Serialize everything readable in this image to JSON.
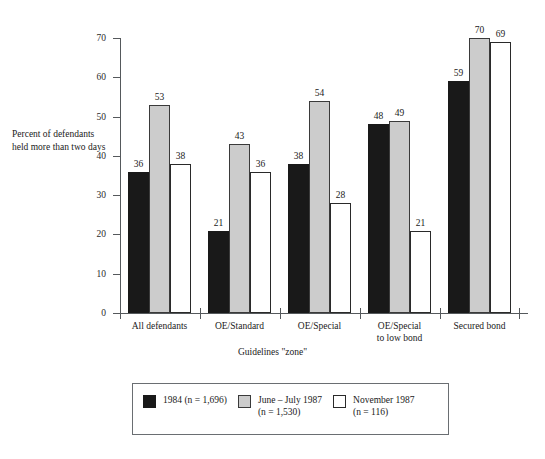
{
  "chart_data": {
    "type": "bar",
    "title": "",
    "xlabel": "Guidelines \"zone\"",
    "ylabel": "Percent of\ndefendants held\nmore than two days",
    "ylim": [
      0,
      70
    ],
    "yticks": [
      0,
      10,
      20,
      30,
      40,
      50,
      60,
      70
    ],
    "ytick_labels": [
      "0",
      "10",
      "20",
      "30",
      "40",
      "50",
      "60",
      "70"
    ],
    "grid": false,
    "legend_position": "bottom",
    "categories": [
      "All defendants",
      "OE/Standard",
      "OE/Special",
      "OE/Special\nto low bond",
      "Secured bond"
    ],
    "series": [
      {
        "name": "1984 (n = 1,696)",
        "color": "#191919",
        "values": [
          36,
          21,
          38,
          48,
          59
        ]
      },
      {
        "name": "June – July 1987\n(n = 1,530)",
        "color": "#cccccc",
        "values": [
          53,
          43,
          54,
          49,
          70
        ]
      },
      {
        "name": "November 1987\n(n = 116)",
        "color": "#ffffff",
        "values": [
          38,
          36,
          28,
          21,
          69
        ]
      }
    ]
  }
}
